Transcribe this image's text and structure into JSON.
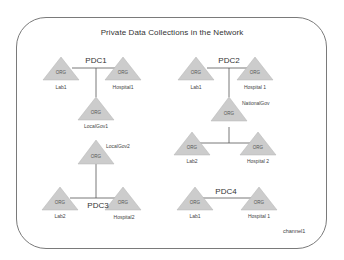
{
  "diagram": {
    "title": "Private Data Collections in the Network",
    "channel_label": "channel1",
    "colors": {
      "triangle_fill": "#cccccc",
      "triangle_stroke": "#b5b5b5",
      "line": "#555555",
      "frame_border": "#7a7a7a",
      "text": "#333333"
    },
    "org_glyph_text": "ORG",
    "collections": [
      {
        "name": "PDC1",
        "orgs": [
          "Lab1",
          "Hospital1",
          "LocalGov1"
        ]
      },
      {
        "name": "PDC2",
        "orgs": [
          "Lab1",
          "Hospital 1",
          "NationalGov",
          "Lab2",
          "Hospital 2"
        ]
      },
      {
        "name": "PDC3",
        "orgs": [
          "LocalGov2",
          "Lab2",
          "Hospital2"
        ]
      },
      {
        "name": "PDC4",
        "orgs": [
          "Lab1",
          "Hospital 1"
        ]
      }
    ],
    "nodes": {
      "pdc1_lab1": "Lab1",
      "pdc1_hospital1": "Hospital1",
      "pdc1_localgov1": "LocalGov1",
      "pdc2_lab1": "Lab1",
      "pdc2_hospital1": "Hospital 1",
      "pdc2_nationalgov": "NationalGov",
      "pdc2_lab2": "Lab2",
      "pdc2_hospital2": "Hospital 2",
      "pdc3_localgov2": "LocalGov2",
      "pdc3_lab2": "Lab2",
      "pdc3_hospital2": "Hospital2",
      "pdc4_lab1": "Lab1",
      "pdc4_hospital1": "Hospital 1"
    },
    "pdc_labels": {
      "pdc1": "PDC1",
      "pdc2": "PDC2",
      "pdc3": "PDC3",
      "pdc4": "PDC4"
    }
  }
}
